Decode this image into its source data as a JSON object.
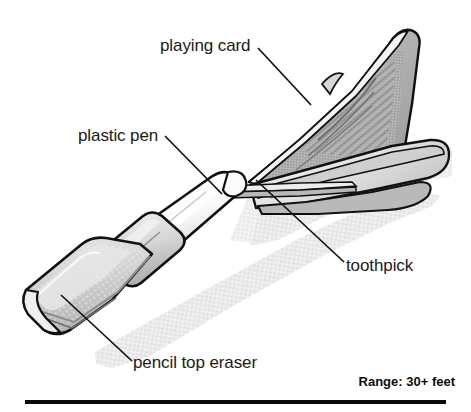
{
  "figure": {
    "domain": "diagram",
    "background_color": "#ffffff",
    "line_color": "#111111",
    "body_fill": "#d6d6d6",
    "body_light_fill": "#f2f2f2",
    "body_mid_fill": "#bfbfbf",
    "body_dark_fill": "#9e9e9e",
    "shadow_color": "#e3e3e3",
    "card_pattern_color": "#8c8c8c"
  },
  "callouts": [
    {
      "key": "playing_card",
      "label": "playing card",
      "name": "callout-playing-card",
      "text_x": 160,
      "text_y": 36,
      "leader": {
        "x1": 258,
        "y1": 48,
        "x2": 311,
        "y2": 105
      }
    },
    {
      "key": "plastic_pen",
      "label": "plastic pen",
      "name": "callout-plastic-pen",
      "text_x": 78,
      "text_y": 126,
      "leader": {
        "x1": 165,
        "y1": 136,
        "x2": 222,
        "y2": 194
      }
    },
    {
      "key": "toothpick",
      "label": "toothpick",
      "name": "callout-toothpick",
      "text_x": 346,
      "text_y": 256,
      "leader": {
        "x1": 256,
        "y1": 180,
        "x2": 344,
        "y2": 262
      }
    },
    {
      "key": "pencil_top_eraser",
      "label": "pencil top eraser",
      "name": "callout-pencil-top-eraser",
      "text_x": 133,
      "text_y": 353,
      "leader": {
        "x1": 61,
        "y1": 295,
        "x2": 132,
        "y2": 361
      }
    }
  ],
  "annotation": {
    "range_text": "Range: 30+ feet"
  },
  "parts": {
    "eraser": "pencil top eraser",
    "pen": "plastic pen",
    "toothpick": "toothpick",
    "fins": "playing card"
  }
}
